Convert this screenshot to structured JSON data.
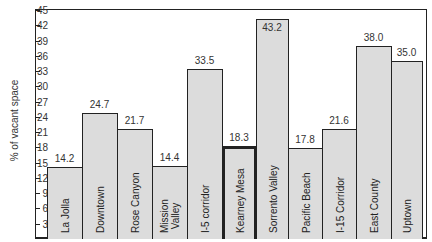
{
  "chart_data": {
    "type": "bar",
    "title": "",
    "xlabel": "",
    "ylabel": "% of vacant space",
    "ylim": [
      0,
      45
    ],
    "yticks": [
      3,
      6,
      9,
      12,
      15,
      18,
      21,
      24,
      27,
      30,
      33,
      36,
      39,
      42,
      45
    ],
    "grid": false,
    "legend": null,
    "categories": [
      "La Jolla",
      "Downtown",
      "Rose Canyon",
      "Mission Valley",
      "I-5 corridor",
      "Kearney Mesa",
      "Sorrento Valley",
      "Pacific Beach",
      "I-15 Corridor",
      "East County",
      "Uptown"
    ],
    "values": [
      14.2,
      24.7,
      21.7,
      14.4,
      33.5,
      18.3,
      43.2,
      17.8,
      21.6,
      38.0,
      35.0
    ],
    "value_labels": [
      "14.2",
      "24.7",
      "21.7",
      "14.4",
      "33.5",
      "18.3",
      "43.2",
      "17.8",
      "21.6",
      "38.0",
      "35.0"
    ],
    "highlighted_category": "Kearney Mesa",
    "bar_color": "#dcdcdc",
    "edge_color": "#222222"
  }
}
